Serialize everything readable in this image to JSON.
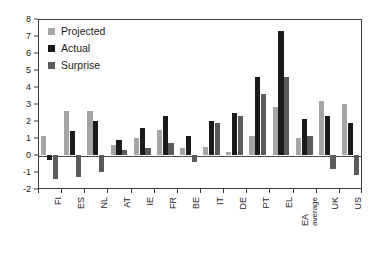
{
  "chart_data": {
    "type": "bar",
    "title": "",
    "subtitle": "",
    "xlabel": "",
    "ylabel": "",
    "ylim": [
      -2,
      8
    ],
    "ytick_step": 1,
    "yticks": [
      "8",
      "7",
      "6",
      "5",
      "4",
      "3",
      "2",
      "1",
      "0",
      "-1",
      "-2"
    ],
    "grid": false,
    "legend_position": "top-left",
    "orientation": "vertical",
    "categories": [
      "FI",
      "ES",
      "NL",
      "AT",
      "IE",
      "FR",
      "BE",
      "IT",
      "DE",
      "PT",
      "EL",
      "EA average",
      "UK",
      "US"
    ],
    "category_labels_rotated": true,
    "series": [
      {
        "name": "Projected",
        "color": "#a5a5a5",
        "values": [
          1.1,
          2.6,
          2.6,
          0.6,
          1.0,
          1.5,
          0.4,
          0.5,
          0.2,
          1.1,
          2.8,
          1.0,
          3.2,
          3.0
        ]
      },
      {
        "name": "Actual",
        "color": "#1a1a1a",
        "values": [
          -0.3,
          1.4,
          2.0,
          0.9,
          1.6,
          2.3,
          1.1,
          2.0,
          2.5,
          4.6,
          7.3,
          2.1,
          2.3,
          1.9
        ]
      },
      {
        "name": "Surprise",
        "color": "#5b5b5b",
        "values": [
          -1.4,
          -1.3,
          -1.0,
          0.3,
          0.4,
          0.7,
          -0.4,
          1.9,
          2.3,
          3.6,
          4.6,
          1.1,
          -0.8,
          -1.2
        ]
      }
    ]
  },
  "legend": {
    "entries": [
      {
        "label": "Projected",
        "color": "#a5a5a5"
      },
      {
        "label": "Actual",
        "color": "#1a1a1a"
      },
      {
        "label": "Surprise",
        "color": "#5b5b5b"
      }
    ]
  },
  "axis": {
    "y_max_label": "8",
    "y_min_label": "-2"
  }
}
